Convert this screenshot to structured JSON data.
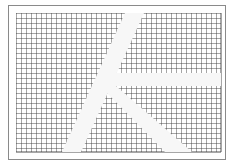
{
  "figure": {
    "colors": {
      "background": "#ffffff",
      "frame": "#8a8a8a",
      "grid_line": "#3a3a3a",
      "band": "#f7f7f7"
    },
    "frame": {
      "x": 8,
      "y": 5,
      "width": 218,
      "height": 155
    },
    "grid_area": {
      "x": 16,
      "y": 13,
      "width": 205,
      "height": 139,
      "cell_size": 5
    },
    "bands": [
      {
        "name": "long-diagonal-band",
        "points": "125,13 144,13 81,152 62,152"
      },
      {
        "name": "horizontal-band",
        "points": "100,73 221,73 221,86 110,86"
      },
      {
        "name": "short-diagonal-band",
        "points": "100,86 116,86 192,152 165,152"
      }
    ]
  }
}
